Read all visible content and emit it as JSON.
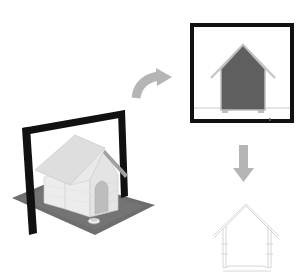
{
  "diagram": {
    "steps": [
      {
        "id": "model-with-section-plane",
        "label": "3D model with section plane"
      },
      {
        "id": "section-view",
        "label": "Section view"
      },
      {
        "id": "section-line-drawing",
        "label": "Section line drawing"
      }
    ],
    "arrows": [
      {
        "from": "model-with-section-plane",
        "to": "section-view",
        "style": "curved"
      },
      {
        "from": "section-view",
        "to": "section-line-drawing",
        "style": "straight-down"
      }
    ],
    "colors": {
      "background": "#ffffff",
      "frame": "#111111",
      "ground": "#6e6e6e",
      "house_face": "#e6e6e6",
      "house_roof": "#d9d9d9",
      "section_fill": "#5f5f5f",
      "section_outline": "#bdbdbd",
      "arrow": "#b5b5b5",
      "line_drawing": "#d8d8d8"
    }
  }
}
